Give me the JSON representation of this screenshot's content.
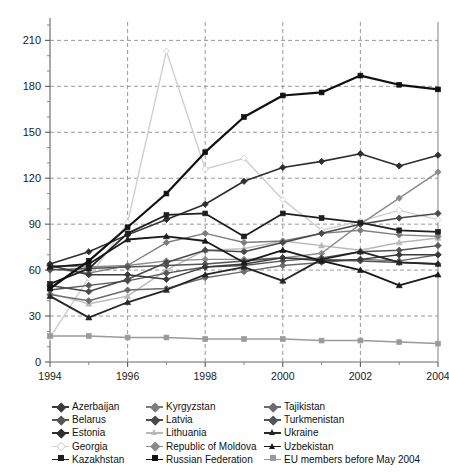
{
  "chart_data": {
    "type": "line",
    "title": "",
    "subtitle": "",
    "xlabel": "",
    "ylabel": "",
    "x": [
      1994,
      1995,
      1996,
      1997,
      1998,
      1999,
      2000,
      2001,
      2002,
      2003,
      2004
    ],
    "xlim": [
      1994,
      2004
    ],
    "ylim": [
      0,
      222
    ],
    "xticks": [
      1994,
      1996,
      1998,
      2000,
      2002,
      2004
    ],
    "xticks_minor": [
      1995,
      1997,
      1999,
      2001,
      2003
    ],
    "yticks": [
      0,
      30,
      60,
      90,
      120,
      150,
      180,
      210
    ],
    "grid": "dashed-both-major",
    "legend_position": "bottom",
    "legend_columns": 3,
    "series": [
      {
        "name": "Azerbaijan",
        "marker": "diamond",
        "color": "#3a3a3a",
        "width": 1.4,
        "values": [
          63,
          57,
          57,
          54,
          62,
          64,
          68,
          66,
          67,
          70,
          70
        ]
      },
      {
        "name": "Belarus",
        "marker": "diamond",
        "color": "#555555",
        "width": 1.4,
        "values": [
          47,
          50,
          53,
          58,
          62,
          63,
          66,
          68,
          72,
          73,
          76
        ]
      },
      {
        "name": "Estonia",
        "marker": "diamond",
        "color": "#2e2e2e",
        "width": 1.6,
        "values": [
          64,
          72,
          83,
          93,
          103,
          118,
          127,
          131,
          136,
          128,
          135
        ]
      },
      {
        "name": "Georgia",
        "marker": "diamond",
        "color": "#cfcfcf",
        "width": 1.4,
        "values": [
          16,
          55,
          91,
          203,
          126,
          133,
          106,
          86,
          92,
          99,
          93
        ]
      },
      {
        "name": "Kazakhstan",
        "marker": "square",
        "color": "#1f1f1f",
        "width": 1.8,
        "values": [
          51,
          61,
          84,
          96,
          97,
          82,
          97,
          94,
          91,
          86,
          85
        ]
      },
      {
        "name": "Kyrgyzstan",
        "marker": "diamond",
        "color": "#7d7d7d",
        "width": 1.4,
        "values": [
          61,
          58,
          63,
          78,
          84,
          78,
          79,
          84,
          86,
          83,
          82
        ]
      },
      {
        "name": "Latvia",
        "marker": "diamond",
        "color": "#4a4a4a",
        "width": 1.5,
        "values": [
          50,
          46,
          54,
          65,
          73,
          72,
          78,
          84,
          90,
          94,
          97
        ]
      },
      {
        "name": "Lithuania",
        "marker": "triangle",
        "color": "#b8b8b8",
        "width": 1.4,
        "values": [
          45,
          38,
          43,
          60,
          73,
          74,
          79,
          76,
          73,
          78,
          81
        ]
      },
      {
        "name": "Republic of Moldova",
        "marker": "diamond",
        "color": "#8a8a8a",
        "width": 1.4,
        "values": [
          63,
          62,
          63,
          66,
          67,
          67,
          68,
          71,
          90,
          107,
          124
        ]
      },
      {
        "name": "Russian Federation",
        "marker": "square",
        "color": "#111111",
        "width": 2.2,
        "values": [
          48,
          66,
          88,
          110,
          137,
          160,
          174,
          176,
          187,
          181,
          178
        ]
      },
      {
        "name": "Tajikistan",
        "marker": "diamond",
        "color": "#6b6b6b",
        "width": 1.4,
        "values": [
          44,
          40,
          47,
          48,
          55,
          59,
          63,
          65,
          67,
          66,
          70
        ]
      },
      {
        "name": "Turkmenistan",
        "marker": "diamond",
        "color": "#555555",
        "width": 1.5,
        "values": [
          60,
          61,
          62,
          63,
          64,
          66,
          68,
          67,
          66,
          65,
          64
        ]
      },
      {
        "name": "Ukraine",
        "marker": "triangle",
        "color": "#262626",
        "width": 1.8,
        "values": [
          43,
          29,
          39,
          47,
          57,
          62,
          53,
          67,
          72,
          65,
          64
        ]
      },
      {
        "name": "Uzbekistan",
        "marker": "triangle",
        "color": "#1a1a1a",
        "width": 1.8,
        "values": [
          62,
          64,
          80,
          82,
          79,
          65,
          73,
          66,
          60,
          50,
          57
        ]
      },
      {
        "name": "EU members before May 2004",
        "marker": "square",
        "color": "#9a9a9a",
        "width": 1.5,
        "values": [
          17,
          17,
          16,
          16,
          15,
          15,
          15,
          14,
          14,
          13,
          12
        ]
      }
    ]
  },
  "legend": {
    "columns": [
      [
        "Azerbaijan",
        "Belarus",
        "Estonia",
        "Georgia",
        "Kazakhstan"
      ],
      [
        "Kyrgyzstan",
        "Latvia",
        "Lithuania",
        "Republic of Moldova",
        "Russian Federation"
      ],
      [
        "Tajikistan",
        "Turkmenistan",
        "Ukraine",
        "Uzbekistan",
        "EU members before May 2004"
      ]
    ]
  }
}
